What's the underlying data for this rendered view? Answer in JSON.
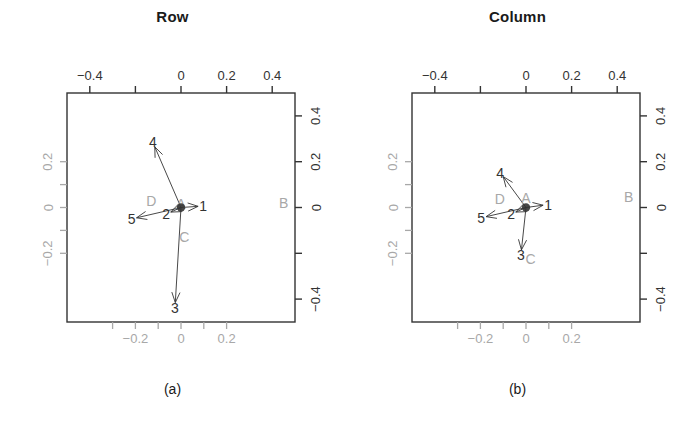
{
  "figure": {
    "background": "#ffffff",
    "ink": "#333333",
    "gray": "#a8a8a8"
  },
  "panels": [
    {
      "id": "a",
      "title": "Row",
      "caption": "(a)",
      "axes": {
        "top": {
          "color": "#333333",
          "ticks": [
            -0.4,
            -0.2,
            0,
            0.2,
            0.4
          ],
          "labels": [
            "−0.4",
            "",
            "0",
            "0.2",
            "0.4"
          ]
        },
        "right": {
          "color": "#333333",
          "ticks": [
            0.4,
            0.2,
            0,
            -0.2,
            -0.4
          ],
          "labels": [
            "0.4",
            "0.2",
            "0",
            "",
            "−0.4"
          ]
        },
        "bottom": {
          "color": "#a8a8a8",
          "ticks": [
            -0.3,
            -0.2,
            -0.1,
            0,
            0.1,
            0.2
          ],
          "labels": [
            "",
            "−0.2",
            "",
            "0",
            "",
            "0.2"
          ]
        },
        "left": {
          "color": "#a8a8a8",
          "ticks": [
            0.2,
            0.1,
            0,
            -0.1,
            -0.2
          ],
          "labels": [
            "0.2",
            "",
            "0",
            "",
            "−0.2"
          ]
        }
      },
      "row_points": [
        {
          "label": "1",
          "x": 0.075,
          "y": 0.005,
          "color": "#333333"
        },
        {
          "label": "2",
          "x": -0.045,
          "y": -0.02,
          "color": "#333333"
        },
        {
          "label": "3",
          "x": -0.025,
          "y": -0.415,
          "color": "#333333"
        },
        {
          "label": "4",
          "x": -0.115,
          "y": 0.265,
          "color": "#333333"
        },
        {
          "label": "5",
          "x": -0.195,
          "y": -0.045,
          "color": "#333333"
        }
      ],
      "column_points": [
        {
          "label": "A",
          "x": 0.0,
          "y": 0.015,
          "color": "#a8a8a8"
        },
        {
          "label": "B",
          "x": 0.45,
          "y": 0.02,
          "color": "#a8a8a8"
        },
        {
          "label": "C",
          "x": 0.015,
          "y": -0.13,
          "color": "#a8a8a8"
        },
        {
          "label": "D",
          "x": -0.13,
          "y": 0.03,
          "color": "#a8a8a8"
        }
      ]
    },
    {
      "id": "b",
      "title": "Column",
      "caption": "(b)",
      "axes": {
        "top": {
          "color": "#333333",
          "ticks": [
            -0.4,
            -0.2,
            0,
            0.2,
            0.4
          ],
          "labels": [
            "−0.4",
            "",
            "0",
            "0.2",
            "0.4"
          ]
        },
        "right": {
          "color": "#333333",
          "ticks": [
            0.4,
            0.2,
            0,
            -0.2,
            -0.4
          ],
          "labels": [
            "0.4",
            "0.2",
            "0",
            "",
            "−0.4"
          ]
        },
        "bottom": {
          "color": "#a8a8a8",
          "ticks": [
            -0.3,
            -0.2,
            -0.1,
            0,
            0.1,
            0.2
          ],
          "labels": [
            "",
            "−0.2",
            "",
            "0",
            "",
            "0.2"
          ]
        },
        "left": {
          "color": "#a8a8a8",
          "ticks": [
            0.2,
            0.1,
            0,
            -0.1,
            -0.2
          ],
          "labels": [
            "0.2",
            "",
            "0",
            "",
            "−0.2"
          ]
        }
      },
      "row_points": [
        {
          "label": "1",
          "x": 0.075,
          "y": 0.01,
          "color": "#333333"
        },
        {
          "label": "2",
          "x": -0.045,
          "y": -0.02,
          "color": "#333333"
        },
        {
          "label": "3",
          "x": -0.02,
          "y": -0.185,
          "color": "#333333"
        },
        {
          "label": "4",
          "x": -0.1,
          "y": 0.135,
          "color": "#333333"
        },
        {
          "label": "5",
          "x": -0.175,
          "y": -0.04,
          "color": "#333333"
        }
      ],
      "column_points": [
        {
          "label": "A",
          "x": 0.0,
          "y": 0.04,
          "color": "#a8a8a8"
        },
        {
          "label": "B",
          "x": 0.45,
          "y": 0.045,
          "color": "#a8a8a8"
        },
        {
          "label": "C",
          "x": 0.02,
          "y": -0.225,
          "color": "#a8a8a8"
        },
        {
          "label": "D",
          "x": -0.115,
          "y": 0.035,
          "color": "#a8a8a8"
        }
      ]
    }
  ],
  "chart_data": {
    "type": "scatter",
    "panels": [
      {
        "name": "Row",
        "caption": "(a)",
        "xlabel": "",
        "ylabel": "",
        "grid": false,
        "legend": "none",
        "axes": {
          "top_xlim": [
            -0.5,
            0.5
          ],
          "top_xticks": [
            -0.4,
            -0.2,
            0,
            0.2,
            0.4
          ],
          "top_xticklabels": [
            "-0.4",
            "",
            "0",
            "0.2",
            "0.4"
          ],
          "right_ylim": [
            -0.5,
            0.5
          ],
          "right_yticks": [
            -0.4,
            -0.2,
            0,
            0.2,
            0.4
          ],
          "right_yticklabels": [
            "-0.4",
            "",
            "0",
            "0.2",
            "0.4"
          ],
          "bottom_xticks": [
            -0.3,
            -0.2,
            -0.1,
            0,
            0.1,
            0.2
          ],
          "bottom_xticklabels": [
            "",
            "-0.2",
            "",
            "0",
            "",
            "0.2"
          ],
          "left_yticks": [
            -0.2,
            -0.1,
            0,
            0.1,
            0.2
          ],
          "left_yticklabels": [
            "-0.2",
            "",
            "0",
            "",
            "0.2"
          ]
        },
        "series": [
          {
            "name": "row points (arrows from origin)",
            "style": "arrow",
            "color": "#333333",
            "labels": [
              "1",
              "2",
              "3",
              "4",
              "5"
            ],
            "x": [
              0.075,
              -0.045,
              -0.025,
              -0.115,
              -0.195
            ],
            "y": [
              0.005,
              -0.02,
              -0.415,
              0.265,
              -0.045
            ]
          },
          {
            "name": "column points",
            "style": "text",
            "color": "#a8a8a8",
            "labels": [
              "A",
              "B",
              "C",
              "D"
            ],
            "x": [
              0.0,
              0.45,
              0.015,
              -0.13
            ],
            "y": [
              0.015,
              0.02,
              -0.13,
              0.03
            ]
          }
        ]
      },
      {
        "name": "Column",
        "caption": "(b)",
        "xlabel": "",
        "ylabel": "",
        "grid": false,
        "legend": "none",
        "axes": {
          "top_xlim": [
            -0.5,
            0.5
          ],
          "top_xticks": [
            -0.4,
            -0.2,
            0,
            0.2,
            0.4
          ],
          "top_xticklabels": [
            "-0.4",
            "",
            "0",
            "0.2",
            "0.4"
          ],
          "right_ylim": [
            -0.5,
            0.5
          ],
          "right_yticks": [
            -0.4,
            -0.2,
            0,
            0.2,
            0.4
          ],
          "right_yticklabels": [
            "-0.4",
            "",
            "0",
            "0.2",
            "0.4"
          ],
          "bottom_xticks": [
            -0.3,
            -0.2,
            -0.1,
            0,
            0.1,
            0.2
          ],
          "bottom_xticklabels": [
            "",
            "-0.2",
            "",
            "0",
            "",
            "0.2"
          ],
          "left_yticks": [
            -0.2,
            -0.1,
            0,
            0.1,
            0.2
          ],
          "left_yticklabels": [
            "-0.2",
            "",
            "0",
            "",
            "0.2"
          ]
        },
        "series": [
          {
            "name": "row points (arrows from origin)",
            "style": "arrow",
            "color": "#333333",
            "labels": [
              "1",
              "2",
              "3",
              "4",
              "5"
            ],
            "x": [
              0.075,
              -0.045,
              -0.02,
              -0.1,
              -0.175
            ],
            "y": [
              0.01,
              -0.02,
              -0.185,
              0.135,
              -0.04
            ]
          },
          {
            "name": "column points",
            "style": "text",
            "color": "#a8a8a8",
            "labels": [
              "A",
              "B",
              "C",
              "D"
            ],
            "x": [
              0.0,
              0.45,
              0.02,
              -0.115
            ],
            "y": [
              0.04,
              0.045,
              -0.225,
              0.035
            ]
          }
        ]
      }
    ]
  }
}
